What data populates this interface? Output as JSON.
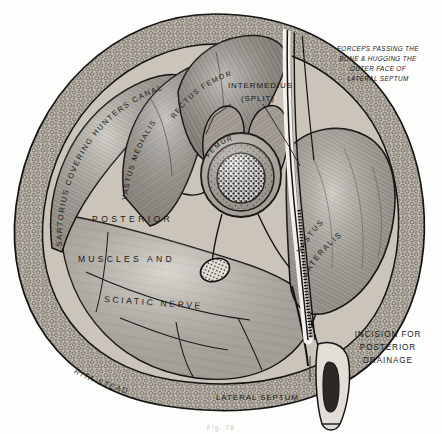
{
  "plate": {
    "title": "Cross-section of the thigh — posterior drainage of femoral abscess",
    "caption": "Fig. 78",
    "artist_signature": "RITA STEAD"
  },
  "labels": {
    "sartorius": "SARTORIUS COVERING HUNTERS CANAL",
    "vastus_medialis": "VASTUS MEDIALIS",
    "rectus_femoris": "RECTUS FEMORIS",
    "intermedius": "INTERMEDIUS",
    "intermedius_qualifier": "(SPLIT)",
    "femur": "FEMUR",
    "vastus_lateralis_line1": "VASTUS",
    "vastus_lateralis_line2": "LATERALIS",
    "posterior": "POSTERIOR",
    "muscles_and": "MUSCLES   AND",
    "sciatic_nerve": "SCIATIC  NERVE",
    "lateral_septum": "LATERAL SEPTUM"
  },
  "annotations": {
    "forceps": {
      "line1": "FORCEPS PASSING THE",
      "line2": "BONE & HUGGING THE",
      "line3": "OUTER FACE OF",
      "line4": "LATERAL SEPTUM"
    },
    "incision": {
      "line1": "INCISION FOR",
      "line2": "POSTERIOR",
      "line3": "DRAINAGE"
    }
  },
  "colors": {
    "paper": "#fdfdfb",
    "ink": "#1a1a1a",
    "muscle_light": "#c9c4bd",
    "muscle_mid": "#a7a199",
    "muscle_dark": "#8b857d",
    "fat": "#b8b2a8",
    "bone_cortex": "#ada69c",
    "marrow": "#3a3732",
    "caption_grey": "#9a9a96"
  }
}
